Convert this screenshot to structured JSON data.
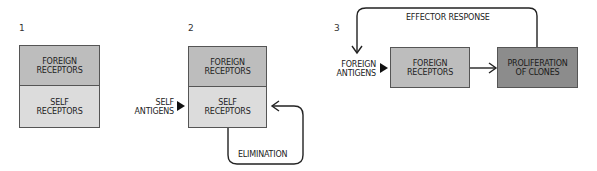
{
  "panels": [
    {
      "number": "1",
      "boxes": {
        "foreign": "FOREIGN RECEPTORS",
        "self": "SELF RECEPTORS"
      }
    },
    {
      "number": "2",
      "input_label": "SELF ANTIGENS",
      "boxes": {
        "foreign": "FOREIGN RECEPTORS",
        "self": "SELF RECEPTORS"
      },
      "loop_label": "ELIMINATION"
    },
    {
      "number": "3",
      "input_label": "FOREIGN ANTIGENS",
      "boxes": {
        "foreign": "FOREIGN RECEPTORS",
        "proliferation": "PROLIFERATION OF CLONES"
      },
      "loop_label": "EFFECTOR RESPONSE"
    }
  ],
  "colors": {
    "foreign_fill": "#bdbdbd",
    "self_fill": "#dcdcdc",
    "proliferation_fill": "#8c8c8c",
    "stroke": "#222222"
  }
}
